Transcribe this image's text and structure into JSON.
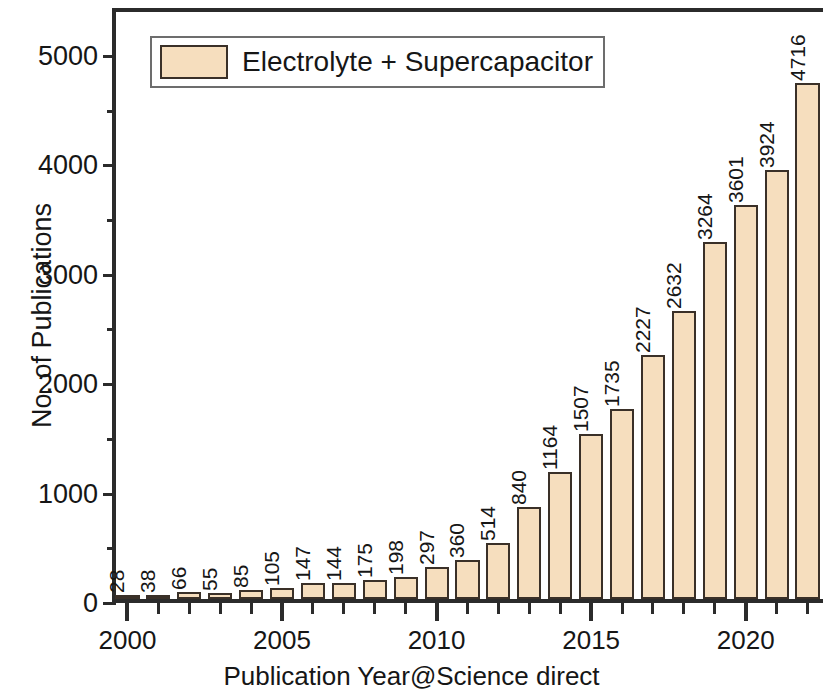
{
  "chart_data": {
    "type": "bar",
    "title": "",
    "xlabel": "Publication Year@Science direct",
    "ylabel": "No. of Publications",
    "legend": [
      {
        "name": "Electrolyte + Supercapacitor",
        "color": "#f6debe"
      }
    ],
    "legend_position": "top-left",
    "grid": false,
    "ylim": [
      0,
      5400
    ],
    "yticks": [
      0,
      1000,
      2000,
      3000,
      4000,
      5000
    ],
    "ytick_labels": [
      "0",
      "1000",
      "2000",
      "3000",
      "4000",
      "5000"
    ],
    "yminor_ticks": [
      500,
      1500,
      2500,
      3500,
      4500
    ],
    "xlim": [
      1999.5,
      2022.5
    ],
    "xticks_major": [
      2000,
      2005,
      2010,
      2015,
      2020
    ],
    "xtick_labels": [
      "2000",
      "2005",
      "2010",
      "2015",
      "2020"
    ],
    "categories": [
      "2000",
      "2001",
      "2002",
      "2003",
      "2004",
      "2005",
      "2006",
      "2007",
      "2008",
      "2009",
      "2010",
      "2011",
      "2012",
      "2013",
      "2014",
      "2015",
      "2016",
      "2017",
      "2018",
      "2019",
      "2020",
      "2021",
      "2022"
    ],
    "values": [
      28,
      38,
      66,
      55,
      85,
      105,
      147,
      144,
      175,
      198,
      297,
      360,
      514,
      840,
      1164,
      1507,
      1735,
      2227,
      2632,
      3264,
      3601,
      3924,
      4716
    ],
    "value_labels": [
      "28",
      "38",
      "66",
      "55",
      "85",
      "105",
      "147",
      "144",
      "175",
      "198",
      "297",
      "360",
      "514",
      "840",
      "1164",
      "1507",
      "1735",
      "2227",
      "2632",
      "3264",
      "3601",
      "3924",
      "4716"
    ],
    "bar_fill_color": "#f6debe",
    "bar_edge_color": "#3a3028",
    "axis_color": "#2b2b2b",
    "text_color": "#161616"
  }
}
